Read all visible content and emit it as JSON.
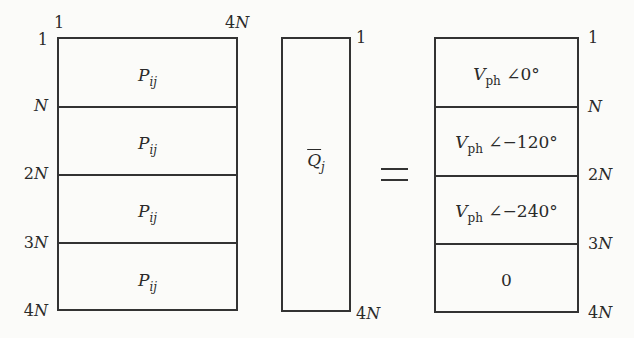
{
  "diagram": {
    "type": "matrix-equation",
    "operator": "=",
    "left_matrix": {
      "name": "P",
      "col_labels": {
        "start": "1",
        "end": "4N"
      },
      "row_labels": [
        "1",
        "N",
        "2N",
        "3N",
        "4N"
      ],
      "blocks": [
        {
          "symbol": "P",
          "subscript": "ij"
        },
        {
          "symbol": "P",
          "subscript": "ij"
        },
        {
          "symbol": "P",
          "subscript": "ij"
        },
        {
          "symbol": "P",
          "subscript": "ij"
        }
      ]
    },
    "middle_vector": {
      "symbol": "Q",
      "subscript": "j",
      "overbar": true,
      "row_labels": {
        "start": "1",
        "end": "4N"
      }
    },
    "right_vector": {
      "row_labels": [
        "1",
        "N",
        "2N",
        "3N",
        "4N"
      ],
      "blocks": [
        {
          "symbol": "V",
          "subscript": "ph",
          "angle_symbol": "∠",
          "angle": "0°"
        },
        {
          "symbol": "V",
          "subscript": "ph",
          "angle_symbol": "∠",
          "angle": "−120°"
        },
        {
          "symbol": "V",
          "subscript": "ph",
          "angle_symbol": "∠",
          "angle": "−240°"
        },
        {
          "value": "0"
        }
      ]
    }
  },
  "labels": {
    "left_col_start": "1",
    "left_col_end_num": "4",
    "left_col_end_var": "N",
    "left_row_1": "1",
    "left_row_N_var": "N",
    "left_row_2N_num": "2",
    "left_row_2N_var": "N",
    "left_row_3N_num": "3",
    "left_row_3N_var": "N",
    "left_row_4N_num": "4",
    "left_row_4N_var": "N",
    "mid_row_start": "1",
    "mid_row_end_num": "4",
    "mid_row_end_var": "N",
    "right_row_1": "1",
    "right_row_N_var": "N",
    "right_row_2N_num": "2",
    "right_row_2N_var": "N",
    "right_row_3N_num": "3",
    "right_row_3N_var": "N",
    "right_row_4N_num": "4",
    "right_row_4N_var": "N"
  }
}
